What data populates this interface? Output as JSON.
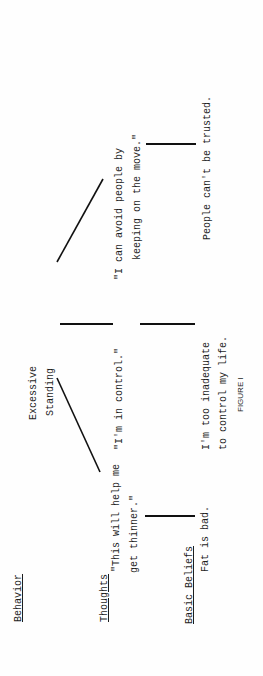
{
  "figure": {
    "caption": "FIGURE I",
    "row_labels": {
      "behavior": "Behavior",
      "thoughts": "Thoughts",
      "basic_beliefs": "Basic Beliefs"
    },
    "root": {
      "behavior": [
        "Excessive",
        "Standing"
      ],
      "thought": "\"I'm in control.\"",
      "belief": [
        "I'm too inadequate",
        "to control my life."
      ]
    },
    "left_branch": {
      "thought": [
        "\"This will help me",
        "get thinner.\""
      ],
      "belief": "Fat is bad."
    },
    "right_branch": {
      "thought": [
        "\"I can avoid people by",
        "keeping on the move.\""
      ],
      "belief": "People can't be trusted."
    }
  }
}
